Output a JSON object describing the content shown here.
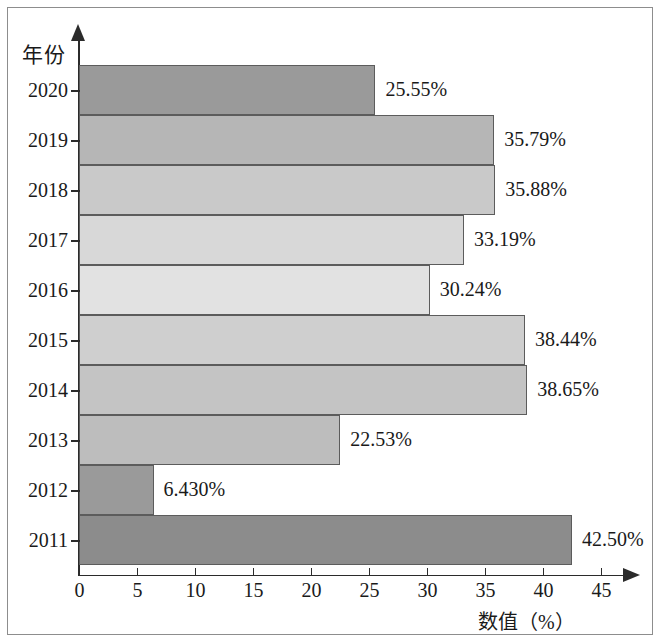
{
  "chart_data": {
    "type": "bar",
    "orientation": "horizontal",
    "title": "",
    "xlabel": "数值（%）",
    "ylabel": "年份",
    "categories": [
      "2020",
      "2019",
      "2018",
      "2017",
      "2016",
      "2015",
      "2014",
      "2013",
      "2012",
      "2011"
    ],
    "values": [
      25.55,
      35.79,
      35.88,
      33.19,
      30.24,
      38.44,
      38.65,
      22.53,
      6.43,
      42.5
    ],
    "value_labels": [
      "25.55%",
      "35.79%",
      "35.88%",
      "33.19%",
      "30.24%",
      "38.44%",
      "38.65%",
      "22.53%",
      "6.430%",
      "42.50%"
    ],
    "bar_colors": [
      "#9a9a9a",
      "#b6b6b6",
      "#c9c9c9",
      "#d8d8d8",
      "#e2e2e2",
      "#cfcfcf",
      "#c4c4c4",
      "#bdbdbd",
      "#9a9a9a",
      "#8c8c8c"
    ],
    "bar_border_color": "#5c5c5c",
    "xlim": [
      0,
      45
    ],
    "xticks": [
      0,
      5,
      10,
      15,
      20,
      25,
      30,
      35,
      40,
      45
    ],
    "xtick_labels": [
      "0",
      "5",
      "10",
      "15",
      "20",
      "25",
      "30",
      "35",
      "40",
      "45"
    ],
    "grid": false,
    "legend": false,
    "axis_color": "#2b2b2b",
    "background": "#ffffff",
    "frame_border_color": "#8d8d8d"
  }
}
